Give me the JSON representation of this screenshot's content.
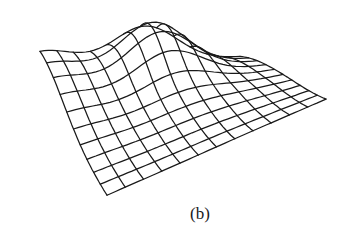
{
  "figure": {
    "caption": "(b)",
    "type": "3d-wireframe-surface",
    "line_color": "#1a1a1a",
    "background": "#ffffff"
  },
  "mesh": {
    "rows": 11,
    "cols": 13,
    "base_corners": {
      "back_left": [
        40,
        96
      ],
      "back_right": [
        240,
        70
      ],
      "front_right": [
        326,
        100
      ],
      "front_left": [
        107,
        196
      ]
    },
    "height_terms": [
      {
        "kind": "gaussian",
        "u": 0.52,
        "v": 0.12,
        "sigma_u": 0.17,
        "sigma_v": 0.2,
        "amp": 58
      },
      {
        "kind": "gaussian",
        "u": 0.0,
        "v": 0.0,
        "sigma_u": 0.22,
        "sigma_v": 0.35,
        "amp": 44
      },
      {
        "kind": "gaussian",
        "u": 1.0,
        "v": 0.15,
        "sigma_u": 0.35,
        "sigma_v": 0.35,
        "amp": 14
      },
      {
        "kind": "gaussian",
        "u": 0.55,
        "v": 0.55,
        "sigma_u": 0.25,
        "sigma_v": 0.2,
        "amp": 10
      }
    ]
  }
}
